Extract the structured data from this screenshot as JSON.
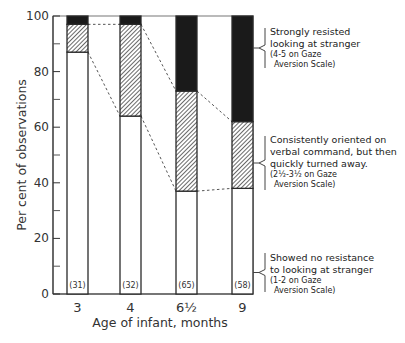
{
  "chart_data": {
    "type": "bar",
    "stacked": true,
    "percent": true,
    "title": "",
    "xlabel": "Age of infant, months",
    "ylabel": "Per cent of observations",
    "ylim": [
      0,
      100
    ],
    "yticks": [
      0,
      20,
      40,
      60,
      80,
      100
    ],
    "yticks_minor": [
      10,
      30,
      50,
      70,
      90
    ],
    "grid": false,
    "categories": [
      "3",
      "4",
      "6½",
      "9"
    ],
    "sample_sizes": [
      "(31)",
      "(32)",
      "(65)",
      "(58)"
    ],
    "series": [
      {
        "name": "Showed no resistance to looking at stranger (1-2 on Gaze Aversion Scale)",
        "key": "no-resistance",
        "fill": "white",
        "values": [
          87,
          64,
          37,
          38
        ]
      },
      {
        "name": "Consistently oriented on verbal command, but then quickly turned away. (2½-3½ on Gaze Aversion Scale)",
        "key": "turned-away",
        "fill": "hatched",
        "values": [
          10,
          33,
          36,
          24
        ]
      },
      {
        "name": "Strongly resisted looking at stranger (4-5 on Gaze Aversion Scale)",
        "key": "strongly-resisted",
        "fill": "black",
        "values": [
          3,
          3,
          27,
          38
        ]
      }
    ],
    "connector_lines": "dashed lines joining segment boundaries between adjacent bars",
    "legend_placement": "right"
  },
  "legend": {
    "strongly_resisted": {
      "line1": "Strongly resisted",
      "line2": "looking at stranger",
      "line3": "(4-5 on Gaze",
      "line4": "Aversion Scale)"
    },
    "turned_away": {
      "line1": "Consistently oriented on",
      "line2": "verbal command, but then",
      "line3": "quickly turned away.",
      "line4": "(2½-3½ on Gaze",
      "line5": "Aversion Scale)"
    },
    "no_resistance": {
      "line1": "Showed no resistance",
      "line2": "to looking at stranger",
      "line3": "(1-2 on Gaze",
      "line4": "Aversion Scale)"
    }
  },
  "colors": {
    "black_segment": "#1a1a1a",
    "hatch": "#555555",
    "outline": "#2a2a2a"
  }
}
